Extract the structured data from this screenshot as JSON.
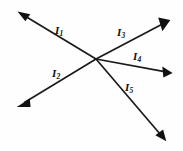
{
  "diagram": {
    "background_color": "#fefefe",
    "line_color": "#1a1a1a",
    "arrow_color": "#111111",
    "width": 183,
    "height": 151,
    "junction": {
      "x": 96,
      "y": 59
    },
    "branches": [
      {
        "id": "I1",
        "label": "I",
        "subscript": "1",
        "direction": "up-left",
        "arrow_at": "tip",
        "from": {
          "x": 96,
          "y": 59
        },
        "to": {
          "x": 18,
          "y": 12
        },
        "label_pos": {
          "x": 55,
          "y": 25
        }
      },
      {
        "id": "I2",
        "label": "I",
        "subscript": "2",
        "direction": "down-left",
        "arrow_at": "tip",
        "from": {
          "x": 96,
          "y": 59
        },
        "to": {
          "x": 17,
          "y": 107
        },
        "label_pos": {
          "x": 52,
          "y": 68
        }
      },
      {
        "id": "I3",
        "label": "I",
        "subscript": "3",
        "direction": "up-right",
        "arrow_at": "tip",
        "from": {
          "x": 96,
          "y": 59
        },
        "to": {
          "x": 170,
          "y": 20
        },
        "label_pos": {
          "x": 117,
          "y": 27
        }
      },
      {
        "id": "I4",
        "label": "I",
        "subscript": "4",
        "direction": "right",
        "arrow_at": "tip",
        "from": {
          "x": 96,
          "y": 59
        },
        "to": {
          "x": 172,
          "y": 73
        },
        "label_pos": {
          "x": 133,
          "y": 51
        }
      },
      {
        "id": "I5",
        "label": "I",
        "subscript": "5",
        "direction": "down-right",
        "arrow_at": "tip",
        "from": {
          "x": 96,
          "y": 59
        },
        "to": {
          "x": 166,
          "y": 141
        },
        "label_pos": {
          "x": 125,
          "y": 82
        }
      }
    ]
  }
}
